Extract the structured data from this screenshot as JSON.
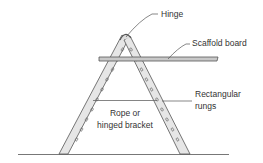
{
  "diagram": {
    "labels": {
      "hinge": "Hinge",
      "scaffold_board": "Scaffold board",
      "rungs_line1": "Rectangular",
      "rungs_line2": "rungs",
      "rope_line1": "Rope or",
      "rope_line2": "hinged bracket"
    },
    "colors": {
      "stroke": "#555555",
      "leg_fill": "#e6e6e6",
      "board_fill": "#c8c8c8",
      "text": "#333333"
    }
  }
}
